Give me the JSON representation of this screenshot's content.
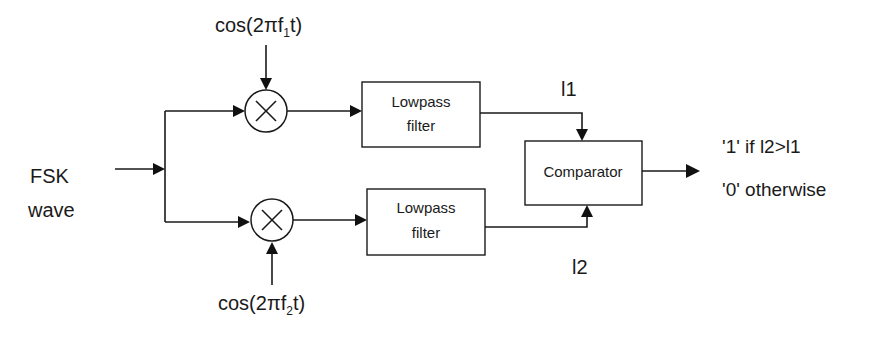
{
  "diagram": {
    "type": "block-diagram",
    "input": {
      "line1": "FSK",
      "line2": "wave"
    },
    "upper_branch": {
      "carrier_prefix": "cos(2πf",
      "carrier_sub": "1",
      "carrier_suffix": "t)",
      "mixer_symbol": "×",
      "filter": {
        "line1": "Lowpass",
        "line2": "filter"
      },
      "output_label": "l1"
    },
    "lower_branch": {
      "carrier_prefix": "cos(2πf",
      "carrier_sub": "2",
      "carrier_suffix": "t)",
      "mixer_symbol": "×",
      "filter": {
        "line1": "Lowpass",
        "line2": "filter"
      },
      "output_label": "l2"
    },
    "comparator": {
      "label": "Comparator"
    },
    "output": {
      "line1": "'1' if l2>l1",
      "line2": "'0' otherwise"
    },
    "colors": {
      "stroke": "#1a1a1a",
      "background": "#ffffff"
    }
  }
}
